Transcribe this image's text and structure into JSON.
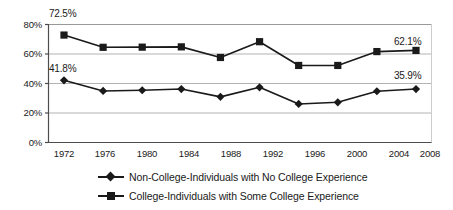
{
  "chart_data": {
    "type": "line",
    "title": "",
    "xlabel": "",
    "ylabel": "",
    "categories": [
      "1972",
      "1976",
      "1980",
      "1984",
      "1988",
      "1992",
      "1996",
      "2000",
      "2004",
      "2008"
    ],
    "ylim": [
      0,
      80
    ],
    "y_ticks": [
      "0%",
      "20%",
      "40%",
      "60%",
      "80%"
    ],
    "y_tick_values": [
      0,
      20,
      40,
      60,
      80
    ],
    "grid": "horizontal",
    "legend_position": "bottom",
    "series": [
      {
        "name": "Non-College-Individuals with No College Experience",
        "marker": "diamond",
        "values": [
          41.8,
          34.6,
          35.1,
          35.9,
          30.6,
          37.1,
          25.8,
          26.9,
          34.4,
          35.9
        ]
      },
      {
        "name": "College-Individuals with Some College Experience",
        "marker": "square",
        "values": [
          72.5,
          64.2,
          64.3,
          64.5,
          57.3,
          68.0,
          51.9,
          51.9,
          61.3,
          62.1
        ]
      }
    ],
    "annotations": [
      {
        "text": "72.5%",
        "series": "College-Individuals with Some College Experience",
        "category": "1972"
      },
      {
        "text": "41.8%",
        "series": "Non-College-Individuals with No College Experience",
        "category": "1972"
      },
      {
        "text": "62.1%",
        "series": "College-Individuals with Some College Experience",
        "category": "2008"
      },
      {
        "text": "35.9%",
        "series": "Non-College-Individuals with No College Experience",
        "category": "2008"
      }
    ],
    "colors": {
      "line": "#1a1a1a",
      "grid": "#b3b3b3",
      "axis": "#4d4d4d",
      "background": "#ffffff"
    }
  }
}
